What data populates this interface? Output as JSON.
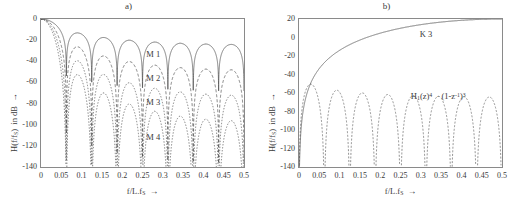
{
  "figure": {
    "width": 515,
    "height": 205,
    "background": "#ffffff",
    "line_color": "#4a4a4a",
    "axis_color": "#8a8a8a"
  },
  "panels": [
    {
      "id": "a",
      "title": "a)",
      "xlabel_html": "f/L.f<sub>S</sub>&nbsp; &#8594;",
      "ylabel_html": "H(f/f<sub>S</sub>)&nbsp; in dB&nbsp; &#8594;",
      "ylabel_plain": "H(f/fS) in dB ->",
      "xlabel_plain": "f/L.fS ->",
      "xticks": [
        "0",
        "0.05",
        "0.1",
        "0.15",
        "0.2",
        "0.25",
        "0.3",
        "0.35",
        "0.4",
        "0.45",
        "0.5"
      ],
      "yticks": [
        "0",
        "-20",
        "-40",
        "-60",
        "-80",
        "-100",
        "-120",
        "-140"
      ],
      "xlim": [
        0,
        0.5
      ],
      "ylim": [
        -140,
        0
      ],
      "curve_labels": [
        {
          "text": "M 1",
          "x": 0.262,
          "y": -34
        },
        {
          "text": "M 2",
          "x": 0.262,
          "y": -57
        },
        {
          "text": "M 3",
          "x": 0.262,
          "y": -79
        },
        {
          "text": "M 4",
          "x": 0.262,
          "y": -113
        }
      ]
    },
    {
      "id": "b",
      "title": "b)",
      "xlabel_html": "f/L.f<sub>S</sub>&nbsp; &#8594;",
      "ylabel_html": "H(f/f<sub>S</sub>)&nbsp; in dB&nbsp; &#8594;",
      "ylabel_plain": "H(f/fS) in dB ->",
      "xlabel_plain": "f/L.fS ->",
      "xticks": [
        "0",
        "0.05",
        "0.1",
        "0.15",
        "0.2",
        "0.25",
        "0.3",
        "0.35",
        "0.4",
        "0.45",
        "0.5"
      ],
      "yticks": [
        "20",
        "0",
        "-20",
        "-40",
        "-60",
        "-80",
        "-100",
        "-120",
        "-140"
      ],
      "xlim": [
        0,
        0.5
      ],
      "ylim": [
        -140,
        20
      ],
      "curve_labels": [
        {
          "text": "K 3",
          "x": 0.3,
          "y": 3
        },
        {
          "text_html": "H<sub>1</sub>(z)<sup>4</sup> &nbsp;&#183; (1-z<sup>-1</sup>)<sup>3</sup>",
          "text": "H1(z)4 . (1-z-1)3",
          "x": 0.278,
          "y": -64
        }
      ]
    }
  ],
  "chart_data": [
    {
      "type": "line",
      "panel": "a",
      "title": "a)",
      "xlabel": "f/L.fS  →",
      "ylabel": "H(f/fS)  in dB  →",
      "xlim": [
        0,
        0.5
      ],
      "ylim": [
        -140,
        0
      ],
      "xticks": [
        0,
        0.05,
        0.1,
        0.15,
        0.2,
        0.25,
        0.3,
        0.35,
        0.4,
        0.45,
        0.5
      ],
      "yticks": [
        0,
        -20,
        -40,
        -60,
        -80,
        -100,
        -120,
        -140
      ],
      "grid": false,
      "legend": "inline-annotations",
      "description": "Magnitude responses of sinc^M (comb/CIC) filters for M = 1..4; nulls at multiples of 1/16 of normalized frequency.",
      "null_spacing": 0.0625,
      "series": [
        {
          "name": "M 1",
          "style": "solid",
          "formula": "20*M*log10(|sin(pi*N*f)/(N*sin(pi*f))|), M=1, N=16",
          "M": 1,
          "first_sidelobe_peak_dB": -13.5,
          "sidelobe_peaks_dB": [
            -13.5,
            -17.8,
            -20.6,
            -22.5,
            -24.0,
            -25.2,
            -26.2,
            -27.0
          ]
        },
        {
          "name": "M 2",
          "style": "dashed",
          "formula": "20*M*log10(|sin(pi*N*f)/(N*sin(pi*f))|), M=2, N=16",
          "M": 2,
          "first_sidelobe_peak_dB": -27.0,
          "sidelobe_peaks_dB": [
            -27.0,
            -35.6,
            -41.2,
            -45.0,
            -48.0,
            -50.4,
            -52.4,
            -54.0
          ]
        },
        {
          "name": "M 3",
          "style": "dotted",
          "formula": "20*M*log10(|sin(pi*N*f)/(N*sin(pi*f))|), M=3, N=16",
          "M": 3,
          "first_sidelobe_peak_dB": -40.5,
          "sidelobe_peaks_dB": [
            -40.5,
            -53.4,
            -61.8,
            -67.5,
            -72.0,
            -75.6,
            -78.6,
            -81.0
          ]
        },
        {
          "name": "M 4",
          "style": "dotted",
          "formula": "20*M*log10(|sin(pi*N*f)/(N*sin(pi*f))|), M=4, N=16",
          "M": 4,
          "first_sidelobe_peak_dB": -54.0,
          "sidelobe_peaks_dB": [
            -54.0,
            -71.2,
            -82.4,
            -90.0,
            -96.0,
            -100.8,
            -104.8,
            -108.0
          ]
        }
      ]
    },
    {
      "type": "line",
      "panel": "b",
      "title": "b)",
      "xlabel": "f/L.fS  →",
      "ylabel": "H(f/fS)  in dB  →",
      "xlim": [
        0,
        0.5
      ],
      "ylim": [
        -140,
        20
      ],
      "xticks": [
        0,
        0.05,
        0.1,
        0.15,
        0.2,
        0.25,
        0.3,
        0.35,
        0.4,
        0.45,
        0.5
      ],
      "yticks": [
        20,
        0,
        -20,
        -40,
        -60,
        -80,
        -100,
        -120,
        -140
      ],
      "grid": false,
      "legend": "inline-annotations",
      "description": "Rising differentiator-like response K 3 saturating near +20 dB, and the cascaded response H1(z)^4 . (1-z^-1)^3 with deep nulls.",
      "null_spacing": 0.0625,
      "series": [
        {
          "name": "K 3",
          "style": "solid",
          "formula": "20*log10(|1 - z^-1|^3) scaled",
          "asymptote_dB": 20,
          "points": [
            {
              "x": 0.0,
              "y": -140
            },
            {
              "x": 0.004,
              "y": -75
            },
            {
              "x": 0.008,
              "y": -60
            },
            {
              "x": 0.015,
              "y": -44
            },
            {
              "x": 0.025,
              "y": -31
            },
            {
              "x": 0.04,
              "y": -19
            },
            {
              "x": 0.06,
              "y": -10
            },
            {
              "x": 0.08,
              "y": -4
            },
            {
              "x": 0.1,
              "y": 1
            },
            {
              "x": 0.13,
              "y": 6
            },
            {
              "x": 0.16,
              "y": 9
            },
            {
              "x": 0.2,
              "y": 12
            },
            {
              "x": 0.25,
              "y": 15
            },
            {
              "x": 0.3,
              "y": 16.6
            },
            {
              "x": 0.35,
              "y": 18
            },
            {
              "x": 0.4,
              "y": 19
            },
            {
              "x": 0.45,
              "y": 19.6
            },
            {
              "x": 0.5,
              "y": 20
            }
          ]
        },
        {
          "name": "H1(z)4 . (1-z-1)3",
          "style": "dashed",
          "formula": "H1(z)^4 * (1-z^-1)^3",
          "sidelobe_peaks_dB": [
            -60,
            -72,
            -70,
            -71,
            -73,
            -75,
            -77,
            -78
          ],
          "null_spacing": 0.0625
        }
      ]
    }
  ]
}
